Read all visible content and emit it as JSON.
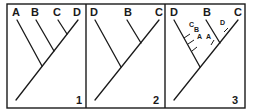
{
  "figure": {
    "panels": [
      {
        "number": "1",
        "tip_labels": [
          "A",
          "B",
          "C",
          "D"
        ],
        "topology": "(A,(B,(C,D)))"
      },
      {
        "number": "2",
        "tip_labels": [
          "D",
          "B",
          "C"
        ],
        "topology": "(D,(B,C))"
      },
      {
        "number": "3",
        "tip_labels": [
          "D",
          "B",
          "C"
        ],
        "topology": "(D,(B,C))",
        "branch_annotations": [
          {
            "label": "C",
            "on_branch": "D"
          },
          {
            "label": "B",
            "on_branch": "D"
          },
          {
            "label": "A",
            "on_branch": "D"
          },
          {
            "label": "A",
            "on_branch": "B"
          },
          {
            "label": "D",
            "on_branch": "C"
          }
        ]
      }
    ]
  }
}
